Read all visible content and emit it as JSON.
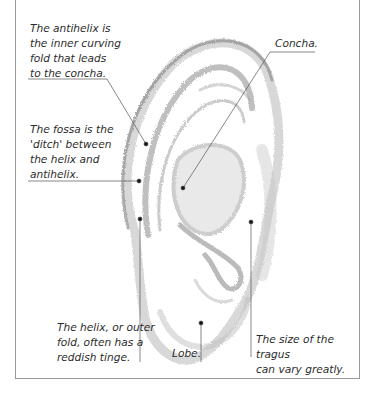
{
  "diagram": {
    "labels": {
      "antihelix": "The antihelix is\nthe inner curving\nfold that leads\nto the concha.",
      "fossa": "The fossa is the\n'ditch' between\nthe helix and\nantihelix.",
      "concha": "Concha.",
      "helix": "The helix, or outer\nfold, often has a\nreddish tinge.",
      "lobe": "Lobe.",
      "tragus": "The size of the tragus\ncan vary greatly."
    },
    "colors": {
      "frame": "#9a9a9a",
      "text": "#2b2b2b",
      "pencil": "#8a8a8a",
      "leader": "#555555"
    }
  }
}
